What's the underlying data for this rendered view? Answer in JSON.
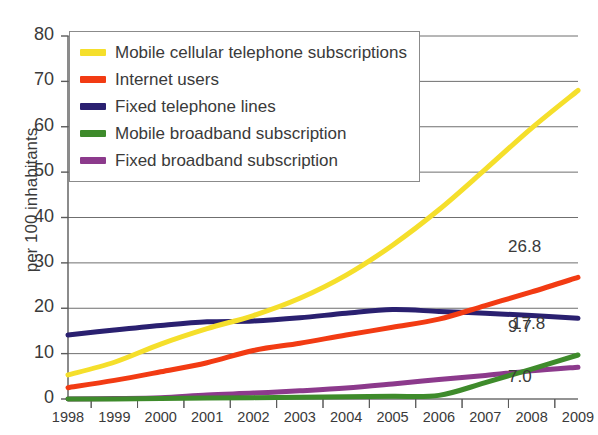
{
  "chart_data": {
    "type": "line",
    "title": "",
    "xlabel": "",
    "ylabel": "per 100 inhabitants",
    "x": [
      1998,
      1999,
      2000,
      2001,
      2002,
      2003,
      2004,
      2005,
      2006,
      2007,
      2008,
      2009
    ],
    "categories": [
      "1998",
      "1999",
      "2000",
      "2001",
      "2002",
      "2003",
      "2004",
      "2005",
      "2006",
      "2007",
      "2008",
      "2009"
    ],
    "xlim": [
      1998,
      2009
    ],
    "ylim": [
      0,
      80
    ],
    "yticks": [
      0,
      10,
      20,
      30,
      40,
      50,
      60,
      70,
      80
    ],
    "ytick_labels": [
      "0",
      "10",
      "20",
      "30",
      "40",
      "50",
      "60",
      "70",
      "80"
    ],
    "grid": "horizontal",
    "legend_position": "upper-left",
    "series": [
      {
        "name": "Mobile cellular telephone subscriptions",
        "color": "#F5DF2B",
        "values": [
          5.3,
          8.1,
          12.1,
          15.5,
          18.4,
          22.2,
          27.3,
          33.9,
          41.7,
          50.6,
          59.7,
          68.0
        ],
        "end_label": ""
      },
      {
        "name": "Internet users",
        "color": "#F23B13",
        "values": [
          2.5,
          4.1,
          6.0,
          8.0,
          10.7,
          12.3,
          14.1,
          15.8,
          17.6,
          20.6,
          23.6,
          26.8
        ],
        "end_label": "26.8"
      },
      {
        "name": "Fixed telephone lines",
        "color": "#2A2070",
        "values": [
          14.1,
          15.2,
          16.2,
          17.0,
          17.2,
          17.9,
          18.9,
          19.7,
          19.3,
          18.9,
          18.4,
          17.8
        ],
        "end_label": "17.8"
      },
      {
        "name": "Mobile broadband subscription",
        "color": "#3E8B2B",
        "values": [
          0.0,
          0.0,
          0.1,
          0.2,
          0.3,
          0.4,
          0.5,
          0.6,
          0.8,
          3.6,
          6.6,
          9.7
        ],
        "end_label": "9.7"
      },
      {
        "name": "Fixed broadband subscription",
        "color": "#8C3A8C",
        "values": [
          0.0,
          0.1,
          0.3,
          0.9,
          1.3,
          1.8,
          2.4,
          3.3,
          4.3,
          5.2,
          6.2,
          7.0
        ],
        "end_label": "7.0"
      }
    ],
    "point_labels": [
      {
        "text": "26.8",
        "series": "Internet users",
        "year": 2009
      },
      {
        "text": "17.8",
        "series": "Fixed telephone lines",
        "year": 2009
      },
      {
        "text": "9.7",
        "series": "Mobile broadband subscription",
        "year": 2009
      },
      {
        "text": "7.0",
        "series": "Fixed broadband subscription",
        "year": 2009
      }
    ]
  },
  "legend": {
    "items": [
      {
        "label": "Mobile cellular telephone subscriptions",
        "color": "#F5DF2B"
      },
      {
        "label": "Internet users",
        "color": "#F23B13"
      },
      {
        "label": "Fixed telephone lines",
        "color": "#2A2070"
      },
      {
        "label": "Mobile broadband subscription",
        "color": "#3E8B2B"
      },
      {
        "label": "Fixed broadband subscription",
        "color": "#8C3A8C"
      }
    ]
  },
  "axes": {
    "y_title": "per 100 inhabitants",
    "y_labels": [
      "80",
      "70",
      "60",
      "50",
      "40",
      "30",
      "20",
      "10",
      "0"
    ],
    "x_labels": [
      "1998",
      "1999",
      "2000",
      "2001",
      "2002",
      "2003",
      "2004",
      "2005",
      "2006",
      "2007",
      "2008",
      "2009"
    ]
  },
  "colors": {
    "axis": "#5a5a5a",
    "grid": "#6f6f6f",
    "text": "#3a3a3a",
    "background": "#ffffff"
  }
}
